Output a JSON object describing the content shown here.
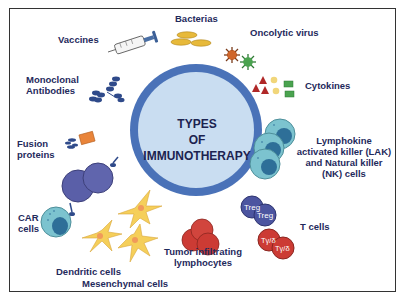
{
  "diagram": {
    "title_lines": [
      "TYPES",
      "OF",
      "IMMUNOTHERAPY"
    ],
    "colors": {
      "hub_ring": "#4a72b8",
      "hub_fill": "#c9ddf1",
      "label_text": "#1f2a5c",
      "frame": "#333333"
    },
    "items": [
      {
        "id": "vaccines",
        "label": "Vaccines",
        "icon": "syringe-icon"
      },
      {
        "id": "bacterias",
        "label": "Bacterias",
        "icon": "bacteria-icon"
      },
      {
        "id": "oncolytic-virus",
        "label": "Oncolytic virus",
        "icon": "virus-icon"
      },
      {
        "id": "cytokines",
        "label": "Cytokines",
        "icon": "cytokine-icon"
      },
      {
        "id": "monoclonal-antibodies",
        "label_lines": [
          "Monoclonal",
          "Antibodies"
        ],
        "icon": "antibody-icon"
      },
      {
        "id": "fusion-proteins",
        "label_lines": [
          "Fusion",
          "proteins"
        ],
        "icon": "fusion-protein-icon"
      },
      {
        "id": "lak-nk",
        "label_lines": [
          "Lymphokine",
          "activated killer (LAK)",
          "and Natural killer",
          "(NK) cells"
        ],
        "icon": "nk-cell-icon"
      },
      {
        "id": "car-cells",
        "label_lines": [
          "CAR",
          "cells"
        ],
        "icon": "car-cell-icon"
      },
      {
        "id": "t-cells",
        "label": "T cells",
        "icon": "t-cell-icon",
        "cell_tags": [
          "Treg",
          "Treg",
          "Tγ/δ",
          "Tγ/δ"
        ]
      },
      {
        "id": "til",
        "label_lines": [
          "Tumor infiltrating",
          "lymphocytes"
        ],
        "icon": "lymphocyte-icon"
      },
      {
        "id": "dendritic",
        "label": "Dendritic cells",
        "icon": "dendritic-cell-icon"
      },
      {
        "id": "mesenchymal",
        "label": "Mesenchymal cells",
        "icon": "mesenchymal-cell-icon"
      }
    ]
  }
}
